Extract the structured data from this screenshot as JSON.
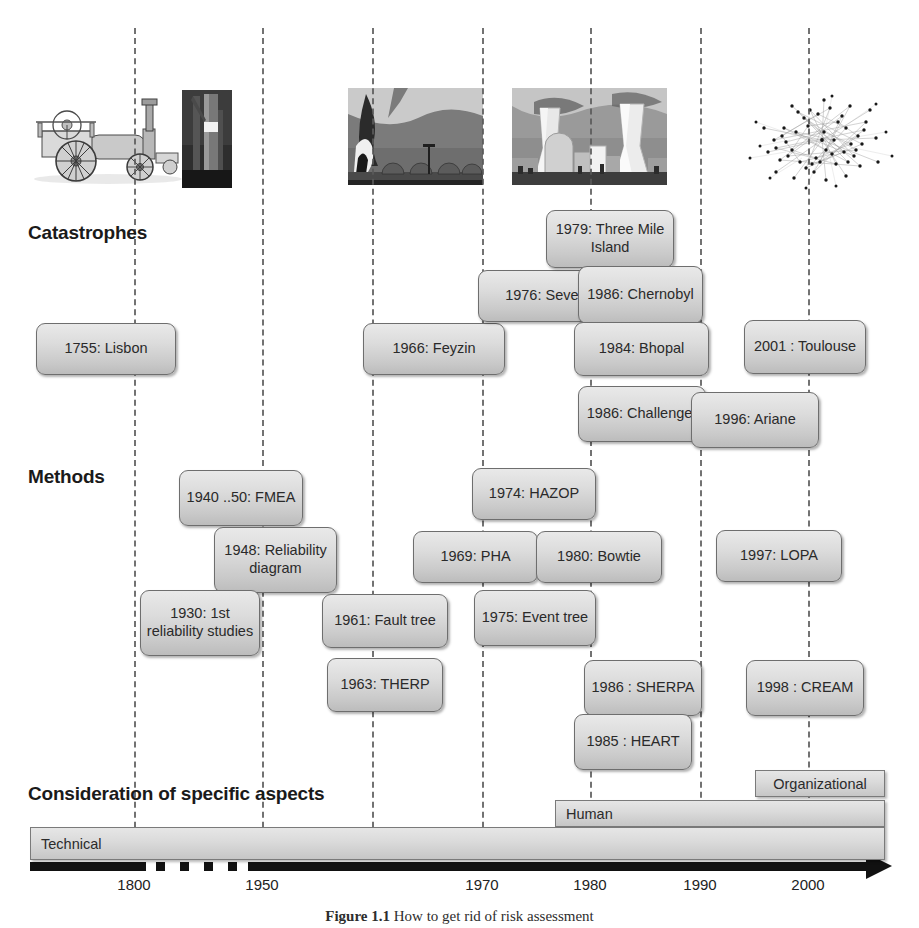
{
  "figure": {
    "caption_label": "Figure 1.1",
    "caption_text": "How to get rid of risk assessment"
  },
  "sections": {
    "catastrophes_label": "Catastrophes",
    "methods_label": "Methods",
    "aspects_label": "Consideration of specific aspects"
  },
  "axis": {
    "ticks": [
      "1800",
      "1950",
      "1970",
      "1980",
      "1990",
      "2000"
    ],
    "tick_positions": [
      134,
      262,
      482,
      590,
      700,
      808
    ],
    "era_lines": [
      134,
      262,
      372,
      482,
      590,
      700,
      808
    ],
    "era_years": [
      "1800",
      "1950",
      "1960",
      "1970",
      "1980",
      "1990",
      "2000"
    ]
  },
  "images": [
    {
      "name": "steam-engine-illustration",
      "alt": "Steam traction engine engraving"
    },
    {
      "name": "rocket-photo",
      "alt": "Rocket on launch pad"
    },
    {
      "name": "industrial-fire-photo",
      "alt": "Burning petrochemical storage tanks"
    },
    {
      "name": "nuclear-plant-photo",
      "alt": "Nuclear power plant cooling towers"
    },
    {
      "name": "network-graph-image",
      "alt": "Dense network graph of nodes and edges"
    }
  ],
  "catastrophes": [
    {
      "label": "1755: Lisbon",
      "x": 36,
      "y": 323,
      "w": 140,
      "h": 52
    },
    {
      "label": "1966: Feyzin",
      "x": 363,
      "y": 323,
      "w": 142,
      "h": 52
    },
    {
      "label": "1976: Seveso",
      "x": 478,
      "y": 270,
      "w": 143,
      "h": 52
    },
    {
      "label": "1979: Three Mile Island",
      "x": 546,
      "y": 210,
      "w": 128,
      "h": 58
    },
    {
      "label": "1986: Chernobyl",
      "x": 578,
      "y": 266,
      "w": 125,
      "h": 58
    },
    {
      "label": "1984: Bhopal",
      "x": 574,
      "y": 322,
      "w": 135,
      "h": 54
    },
    {
      "label": "2001 : Toulouse",
      "x": 744,
      "y": 320,
      "w": 122,
      "h": 54
    },
    {
      "label": "1986: Challenger",
      "x": 578,
      "y": 386,
      "w": 128,
      "h": 56
    },
    {
      "label": "1996: Ariane",
      "x": 691,
      "y": 392,
      "w": 128,
      "h": 56
    }
  ],
  "methods": [
    {
      "label": "1940 ..50: FMEA",
      "x": 179,
      "y": 470,
      "w": 124,
      "h": 56
    },
    {
      "label": "1948: Reliability diagram",
      "x": 214,
      "y": 527,
      "w": 123,
      "h": 66
    },
    {
      "label": "1930: 1st reliability studies",
      "x": 140,
      "y": 590,
      "w": 120,
      "h": 66
    },
    {
      "label": "1961: Fault tree",
      "x": 322,
      "y": 594,
      "w": 126,
      "h": 54
    },
    {
      "label": "1963: THERP",
      "x": 327,
      "y": 658,
      "w": 116,
      "h": 54
    },
    {
      "label": "1974: HAZOP",
      "x": 472,
      "y": 468,
      "w": 124,
      "h": 52
    },
    {
      "label": "1969: PHA",
      "x": 413,
      "y": 531,
      "w": 125,
      "h": 52
    },
    {
      "label": "1980: Bowtie",
      "x": 536,
      "y": 531,
      "w": 126,
      "h": 52
    },
    {
      "label": "1975: Event tree",
      "x": 474,
      "y": 590,
      "w": 122,
      "h": 56
    },
    {
      "label": "1997: LOPA",
      "x": 716,
      "y": 530,
      "w": 126,
      "h": 52
    },
    {
      "label": "1986 : SHERPA",
      "x": 584,
      "y": 660,
      "w": 118,
      "h": 56
    },
    {
      "label": "1985 : HEART",
      "x": 574,
      "y": 714,
      "w": 118,
      "h": 56
    },
    {
      "label": "1998 : CREAM",
      "x": 746,
      "y": 660,
      "w": 118,
      "h": 56
    }
  ],
  "aspect_bars": [
    {
      "label": "Organizational",
      "x": 755,
      "y": 770,
      "w": 130,
      "h": 27,
      "centered": true
    },
    {
      "label": "Human",
      "x": 555,
      "y": 800,
      "w": 330,
      "h": 27,
      "centered": false
    },
    {
      "label": "Technical",
      "x": 30,
      "y": 827,
      "w": 855,
      "h": 33,
      "centered": false
    }
  ],
  "colors": {
    "box_border": "#6e6e6e",
    "box_fill_light": "#e9e9e9",
    "box_fill_dark": "#bcbcbc",
    "era_line": "#5a5a5a",
    "axis": "#111111",
    "text": "#2a2a2a"
  }
}
